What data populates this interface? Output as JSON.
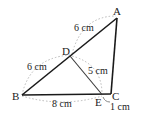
{
  "diagram": {
    "points": {
      "A": "A",
      "B": "B",
      "C": "C",
      "D": "D",
      "E": "E"
    },
    "lengths": {
      "AD": "6 cm",
      "DB": "6 cm",
      "DE": "5 cm",
      "BE": "8 cm",
      "EC": "1 cm"
    },
    "colors": {
      "line": "#1a1a1a",
      "dotted": "#b8b8b8"
    }
  }
}
